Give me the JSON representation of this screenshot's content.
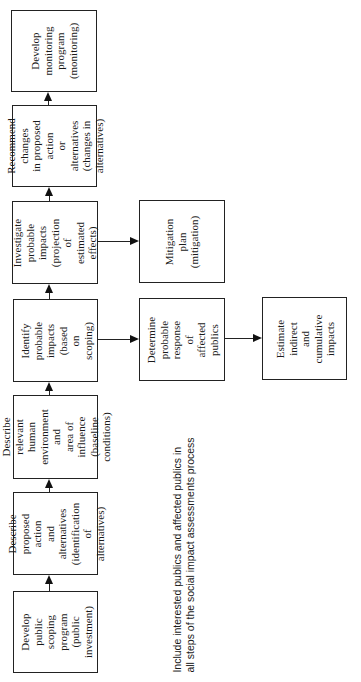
{
  "diagram": {
    "orientation": "rotated-90-ccw",
    "main_flow": [
      {
        "id": "step1",
        "label": "Develop public\nscoping program\n(public\ninvestment)"
      },
      {
        "id": "step2",
        "label": "Describe\nproposed action\nand alternatives\n(identification\nof alternatives)"
      },
      {
        "id": "step3",
        "label": "Describe relevant\nhuman\nenvironment and\narea of influence\n(baseline\nconditions)"
      },
      {
        "id": "step4",
        "label": "Identify probable\nimpacts\n(based on\nscoping)"
      },
      {
        "id": "step5",
        "label": "Investigate\nprobable impacts\n(projection of\nestimated effects)"
      },
      {
        "id": "step6",
        "label": "Recommend\nchanges\nin proposed action\nor alternatives\n(changes in\nalternatives)"
      },
      {
        "id": "step7",
        "label": "Develop\nmonitoring\nprogram\n(monitoring)"
      }
    ],
    "branches": [
      {
        "id": "mitigation",
        "label": "Mitigation plan\n(mitigation)",
        "from": "step5"
      },
      {
        "id": "determine",
        "label": "Determine\nprobable\nresponse of\naffected publics",
        "from": "step4"
      },
      {
        "id": "estimate",
        "label": "Estimate\nindirect and\ncumulative\nimpacts",
        "from": "determine"
      }
    ],
    "note": {
      "line1": "Include interested publics and affected publics in",
      "line2": "all steps of the social impact assessments process"
    }
  }
}
